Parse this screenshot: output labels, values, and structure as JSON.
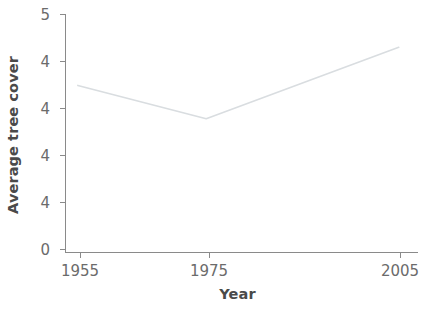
{
  "chart_data": {
    "type": "line",
    "title": "",
    "xlabel": "Year",
    "ylabel": "Average tree cover",
    "x": [
      1955,
      1975,
      2005
    ],
    "values": [
      3.5,
      2.8,
      4.3
    ],
    "series": [
      {
        "name": "Average tree cover",
        "x": [
          1955,
          1975,
          2005
        ],
        "values": [
          3.5,
          2.8,
          4.3
        ]
      }
    ],
    "xlim": [
      1953,
      2008
    ],
    "ylim": [
      0,
      5
    ],
    "xtick_labels": [
      "1955",
      "1975",
      "2005"
    ],
    "xtick_values": [
      1955,
      1975,
      2005
    ],
    "ytick_labels": [
      "5",
      "4",
      "4",
      "4",
      "4",
      "0"
    ],
    "ytick_values": [
      5,
      4,
      3,
      2,
      1,
      0
    ],
    "grid": false,
    "legend": false,
    "legend_position": "none",
    "line_color": "#d9dde0",
    "axis_color": "#8a8a8a",
    "text_color": "#6b6b6b",
    "title_color": "#4a4a4a",
    "background": "#ffffff"
  },
  "axes": {
    "y_title": "Average tree cover",
    "x_title": "Year"
  },
  "ticks": {
    "y": [
      {
        "label": "5"
      },
      {
        "label": "4"
      },
      {
        "label": "4"
      },
      {
        "label": "4"
      },
      {
        "label": "4"
      },
      {
        "label": "0"
      }
    ],
    "x": [
      {
        "label": "1955"
      },
      {
        "label": "1975"
      },
      {
        "label": "2005"
      }
    ]
  }
}
